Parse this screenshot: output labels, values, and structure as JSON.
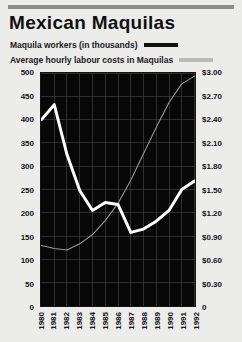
{
  "title": "Mexican Maquilas",
  "legend": [
    {
      "label": "Maquila workers (in thousands)",
      "swatch": "dark",
      "color": "#101010"
    },
    {
      "label": "Average hourly labour costs in Maquilas",
      "swatch": "gray",
      "color": "#b9b9b9"
    }
  ],
  "chart_data": {
    "type": "line",
    "title": "Mexican Maquilas",
    "xlabel": "",
    "ylabel": "Maquila workers (in thousands)",
    "y2label": "Average hourly labour costs in Maquilas",
    "grid": true,
    "legend_position": "top",
    "plot_background": "#070707",
    "categories": [
      "1980",
      "1981",
      "1982",
      "1983",
      "1984",
      "1985",
      "1986",
      "1987",
      "1988",
      "1989",
      "1990",
      "1991",
      "1992"
    ],
    "ylim": [
      0,
      500
    ],
    "yticks": [
      "0",
      "50",
      "100",
      "150",
      "200",
      "250",
      "300",
      "350",
      "400",
      "450",
      "500"
    ],
    "y2lim": [
      0,
      3.0
    ],
    "y2ticks": [
      "0",
      "$0.30",
      "$0.60",
      "$0.90",
      "$1.20",
      "$1.50",
      "$1.80",
      "$2.10",
      "$2.40",
      "$2.70",
      "$3.00"
    ],
    "series": [
      {
        "name": "Maquila workers (in thousands)",
        "axis": "left",
        "color": "#ffffff",
        "values": [
          400,
          432,
          325,
          248,
          205,
          222,
          218,
          158,
          165,
          182,
          205,
          250,
          268
        ]
      },
      {
        "name": "Average hourly labour costs in Maquilas",
        "axis": "right",
        "color": "#9a9a9a",
        "values": [
          0.78,
          0.74,
          0.72,
          0.8,
          0.92,
          1.1,
          1.32,
          1.62,
          1.96,
          2.3,
          2.62,
          2.86,
          2.96
        ]
      }
    ]
  }
}
